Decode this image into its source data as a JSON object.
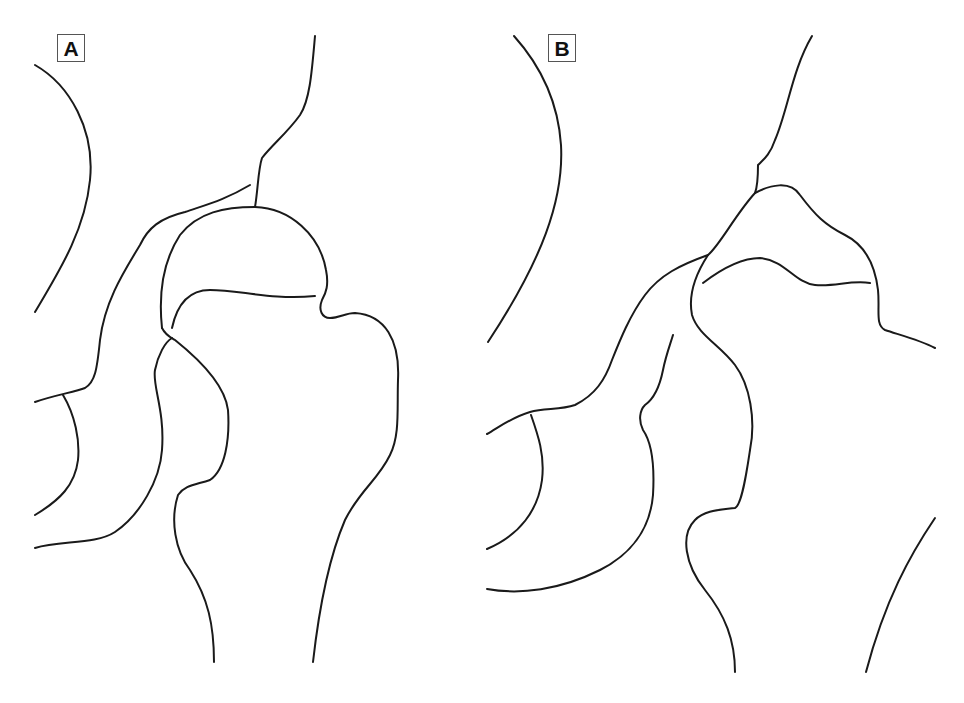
{
  "figure": {
    "panels": [
      {
        "id": "A",
        "label": "A",
        "description": "Hip joint line drawing with spherical femoral head"
      },
      {
        "id": "B",
        "label": "B",
        "description": "Hip joint line drawing with flattened / deformed femoral head"
      }
    ],
    "colors": {
      "line": "#1a1a1a",
      "background": "#ffffff",
      "label_border": "#555555"
    }
  }
}
